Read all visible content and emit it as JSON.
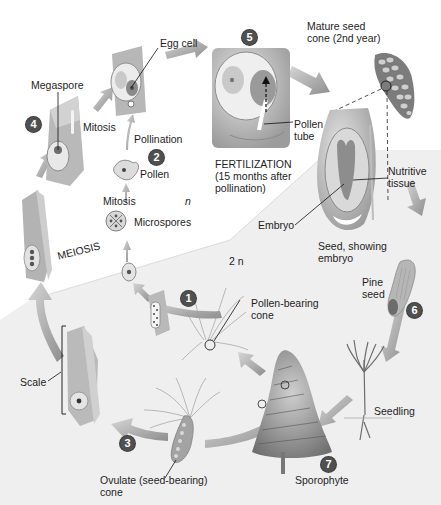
{
  "figure": {
    "colors": {
      "badge": "#505050",
      "arrow": "#9a9a9a",
      "haploid_bg": "#ffffff",
      "diploid_bg": "#ececec",
      "structure_fill": "#b8b8b8",
      "label_text": "#1e1e1e"
    },
    "steps": [
      {
        "number": "1",
        "label": "Pollen-bearing cone"
      },
      {
        "number": "2",
        "label": "Pollen"
      },
      {
        "number": "3",
        "label": "Ovulate (seed-bearing) cone"
      },
      {
        "number": "4",
        "label": "Megaspore"
      },
      {
        "number": "5",
        "label": "FERTILIZATION (15 months after pollination)"
      },
      {
        "number": "6",
        "label": "Pine seed"
      },
      {
        "number": "7",
        "label": "Sporophyte"
      }
    ],
    "labels": {
      "egg_cell": "Egg cell",
      "megaspore": "Megaspore",
      "mitosis_top": "Mitosis",
      "pollination": "Pollination",
      "pollen": "Pollen",
      "mitosis_mid": "Mitosis",
      "haploid": "n",
      "microspores": "Microspores",
      "meiosis": "MEIOSIS",
      "diploid": "2 n",
      "scale": "Scale",
      "ovulate_cone": "Ovulate (seed-bearing)\ncone",
      "pollen_bearing_cone": "Pollen-bearing\ncone",
      "fertilization": "FERTILIZATION\n(15 months after\npollination)",
      "pollen_tube": "Pollen\ntube",
      "mature_seed_cone": "Mature seed\ncone (2nd year)",
      "nutritive_tissue": "Nutritive\ntissue",
      "embryo": "Embryo",
      "seed_showing_embryo": "Seed, showing\nembryo",
      "pine_seed": "Pine\nseed",
      "seedling": "Seedling",
      "sporophyte": "Sporophyte"
    }
  }
}
